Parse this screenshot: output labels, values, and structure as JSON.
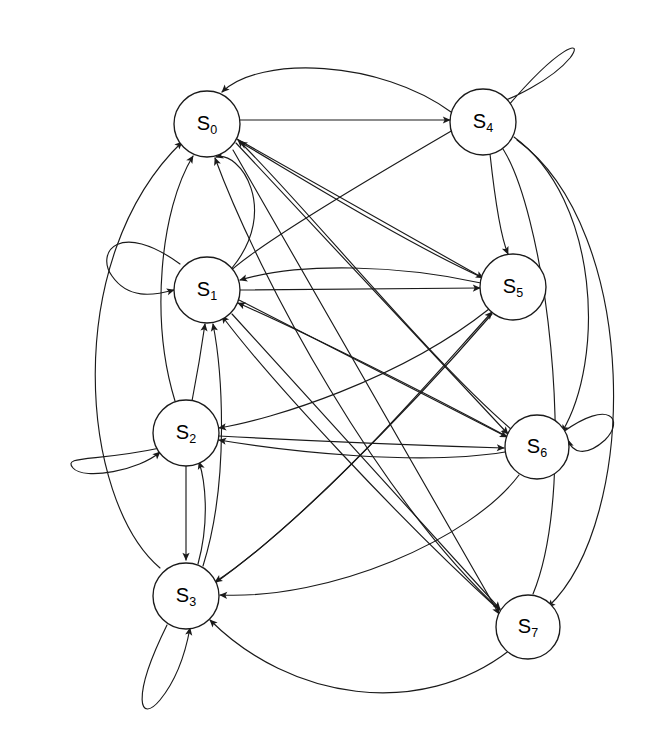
{
  "diagram": {
    "type": "directed-state-graph",
    "canvas": {
      "width": 670,
      "height": 746
    },
    "style": {
      "background_color": "#ffffff",
      "edge_color": "#1a1a1a",
      "node_fill_color": "#ffffff",
      "node_stroke_color": "#1a1a1a",
      "label_color": "#000000",
      "node_radius": 33,
      "edge_width": 1.15
    },
    "nodes": [
      {
        "id": "S0",
        "base": "S",
        "sub": "0",
        "label": "S0",
        "cx": 207,
        "cy": 124,
        "r": 33
      },
      {
        "id": "S1",
        "base": "S",
        "sub": "1",
        "label": "S1",
        "cx": 207,
        "cy": 290,
        "r": 33
      },
      {
        "id": "S2",
        "base": "S",
        "sub": "2",
        "label": "S2",
        "cx": 186,
        "cy": 433,
        "r": 33
      },
      {
        "id": "S3",
        "base": "S",
        "sub": "3",
        "label": "S3",
        "cx": 186,
        "cy": 596,
        "r": 33
      },
      {
        "id": "S4",
        "base": "S",
        "sub": "4",
        "label": "S4",
        "cx": 483,
        "cy": 122,
        "r": 33
      },
      {
        "id": "S5",
        "base": "S",
        "sub": "5",
        "label": "S5",
        "cx": 513,
        "cy": 287,
        "r": 33
      },
      {
        "id": "S6",
        "base": "S",
        "sub": "6",
        "label": "S6",
        "cx": 537,
        "cy": 447,
        "r": 32
      },
      {
        "id": "S7",
        "base": "S",
        "sub": "7",
        "label": "S7",
        "cx": 528,
        "cy": 627,
        "r": 32
      }
    ],
    "edges": [
      {
        "from": "S0",
        "to": "S4",
        "kind": "straight"
      },
      {
        "from": "S0",
        "to": "S5",
        "kind": "curve"
      },
      {
        "from": "S0",
        "to": "S6",
        "kind": "curve"
      },
      {
        "from": "S0",
        "to": "S7",
        "kind": "curve"
      },
      {
        "from": "S1",
        "to": "S1",
        "kind": "self-loop"
      },
      {
        "from": "S1",
        "to": "S5",
        "kind": "straight"
      },
      {
        "from": "S1",
        "to": "S0",
        "kind": "curve"
      },
      {
        "from": "S1",
        "to": "S6",
        "kind": "curve"
      },
      {
        "from": "S1",
        "to": "S7",
        "kind": "curve"
      },
      {
        "from": "S2",
        "to": "S2",
        "kind": "self-loop"
      },
      {
        "from": "S2",
        "to": "S3",
        "kind": "straight"
      },
      {
        "from": "S2",
        "to": "S0",
        "kind": "curve"
      },
      {
        "from": "S2",
        "to": "S1",
        "kind": "curve"
      },
      {
        "from": "S2",
        "to": "S6",
        "kind": "curve"
      },
      {
        "from": "S3",
        "to": "S3",
        "kind": "self-loop"
      },
      {
        "from": "S3",
        "to": "S2",
        "kind": "curve"
      },
      {
        "from": "S3",
        "to": "S1",
        "kind": "curve"
      },
      {
        "from": "S3",
        "to": "S0",
        "kind": "curve"
      },
      {
        "from": "S3",
        "to": "S5",
        "kind": "curve"
      },
      {
        "from": "S4",
        "to": "S4",
        "kind": "self-loop"
      },
      {
        "from": "S4",
        "to": "S5",
        "kind": "curve"
      },
      {
        "from": "S4",
        "to": "S6",
        "kind": "curve"
      },
      {
        "from": "S4",
        "to": "S7",
        "kind": "curve"
      },
      {
        "from": "S4",
        "to": "S0",
        "kind": "curve"
      },
      {
        "from": "S4",
        "to": "S1",
        "kind": "curve"
      },
      {
        "from": "S5",
        "to": "S0",
        "kind": "curve"
      },
      {
        "from": "S5",
        "to": "S1",
        "kind": "curve"
      },
      {
        "from": "S5",
        "to": "S2",
        "kind": "curve"
      },
      {
        "from": "S5",
        "to": "S3",
        "kind": "curve"
      },
      {
        "from": "S6",
        "to": "S6",
        "kind": "self-loop"
      },
      {
        "from": "S6",
        "to": "S0",
        "kind": "curve"
      },
      {
        "from": "S6",
        "to": "S1",
        "kind": "curve"
      },
      {
        "from": "S6",
        "to": "S2",
        "kind": "curve"
      },
      {
        "from": "S6",
        "to": "S3",
        "kind": "curve"
      },
      {
        "from": "S7",
        "to": "S0",
        "kind": "curve"
      },
      {
        "from": "S7",
        "to": "S1",
        "kind": "curve"
      },
      {
        "from": "S7",
        "to": "S3",
        "kind": "curve"
      },
      {
        "from": "S7",
        "to": "S4",
        "kind": "curve"
      }
    ]
  },
  "paths": {
    "s0_s4": "M 240 120 L 450 120",
    "s0_s5": "M 237 139 L 483 278",
    "s0_s6": "M 236 143 L 508 434",
    "s0_s7": "M 233 150 L 499 614",
    "s1_self": "M 180 264 C 120 220, 95 252, 112 276 C 128 299, 152 296, 174 290",
    "s1_s5": "M 240 290 L 480 288",
    "s1_s0": "M 232 268 C 280 210, 240 150, 216 157",
    "s1_s6": "M 239 300 L 507 437",
    "s1_s7": "M 232 314 L 500 609",
    "s2_self": "M 160 448 C 95 462, 62 455, 73 468 C 84 481, 140 470, 160 452",
    "s2_s3": "M 186 466 L 186 560",
    "s2_s0": "M 175 401 C 150 320, 160 210, 193 156",
    "s2_s1": "M 192 401 C 198 370, 202 345, 205 324",
    "s2_s6": "M 219 436 C 330 442, 440 446, 504 448",
    "s3_self": "M 167 625 C 130 700, 140 724, 160 700 C 178 678, 186 650, 190 628",
    "s3_s2": "M 198 564 C 210 520, 205 480, 199 462",
    "s3_s1": "M 203 566 C 230 480, 222 370, 213 324",
    "s3_s0": "M 160 568 C 80 500, 60 260, 182 142",
    "s3_s5": "M 214 584 C 330 500, 430 380, 492 312",
    "s4_self": "M 508 106 C 560 45, 585 38, 570 58 C 552 80, 510 100, 494 104",
    "s4_s5": "M 490 154 C 495 200, 502 240, 508 254",
    "s4_s6": "M 514 137 C 600 200, 605 360, 562 432",
    "s4_s7": "M 517 140 C 640 230, 640 520, 548 607",
    "s4_s0": "M 451 112 C 380 60, 260 55, 222 92",
    "s4_s1": "M 453 130 C 350 190, 250 250, 225 276",
    "s5_s0": "M 481 277 C 400 240, 280 165, 240 142",
    "s5_s1": "M 481 283 C 400 265, 300 262, 240 280",
    "s5_s2": "M 489 309 C 400 380, 270 420, 219 428",
    "s5_s3": "M 492 314 C 400 420, 280 540, 215 582",
    "s6_self": "M 563 432 C 610 398, 625 420, 605 440 C 585 458, 572 452, 568 440",
    "s6_s0": "M 511 429 C 430 360, 300 200, 238 140",
    "s6_s1": "M 508 437 C 420 390, 300 330, 238 303",
    "s6_s2": "M 505 452 C 420 466, 290 452, 219 440",
    "s6_s3": "M 519 475 C 470 540, 330 600, 220 595",
    "s7_s0": "M 502 612 C 380 500, 260 280, 215 158",
    "s7_s1": "M 499 610 C 400 520, 270 380, 222 316",
    "s7_s3": "M 510 650 C 420 720, 290 700, 210 620",
    "s7_s4": "M 533 594 C 580 480, 545 200, 498 142"
  }
}
